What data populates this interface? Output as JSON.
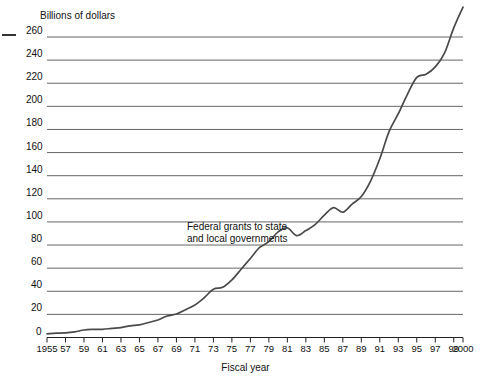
{
  "chart_data": {
    "type": "line",
    "title": "",
    "ylabel": "Billions of dollars",
    "xlabel": "Fiscal year",
    "ylim": [
      0,
      260
    ],
    "ytick_step": 20,
    "yticks": [
      260,
      240,
      220,
      200,
      180,
      160,
      140,
      120,
      100,
      80,
      60,
      40,
      20,
      0
    ],
    "xlim": [
      1955,
      2000
    ],
    "xticks": [
      1955,
      1957,
      1959,
      1961,
      1963,
      1965,
      1967,
      1969,
      1971,
      1973,
      1975,
      1977,
      1979,
      1981,
      1983,
      1985,
      1987,
      1989,
      1991,
      1993,
      1995,
      1997,
      1999,
      2000
    ],
    "xtick_labels": [
      "1955",
      "57",
      "59",
      "61",
      "63",
      "65",
      "67",
      "69",
      "71",
      "73",
      "75",
      "77",
      "79",
      "81",
      "83",
      "85",
      "87",
      "89",
      "91",
      "93",
      "95",
      "97",
      "99",
      "2000"
    ],
    "grid": "horizontal",
    "legend": "none",
    "annotation": {
      "line1": "Federal grants to state",
      "line2": "and local governments"
    },
    "series": [
      {
        "name": "Federal grants to state and local governments",
        "color": "#4a4a4a",
        "x": [
          1955,
          1956,
          1957,
          1958,
          1959,
          1960,
          1961,
          1962,
          1963,
          1964,
          1965,
          1966,
          1967,
          1968,
          1969,
          1970,
          1971,
          1972,
          1973,
          1974,
          1975,
          1976,
          1977,
          1978,
          1979,
          1980,
          1981,
          1982,
          1983,
          1984,
          1985,
          1986,
          1987,
          1988,
          1989,
          1990,
          1991,
          1992,
          1993,
          1994,
          1995,
          1996,
          1997,
          1998,
          1999,
          2000
        ],
        "values": [
          3.2,
          3.7,
          4.0,
          4.9,
          6.5,
          7.0,
          7.1,
          7.9,
          8.6,
          10.1,
          10.9,
          13.0,
          15.2,
          18.6,
          20.3,
          24.1,
          28.1,
          34.4,
          41.8,
          43.4,
          49.8,
          59.1,
          68.4,
          77.9,
          82.9,
          91.4,
          94.8,
          88.2,
          92.5,
          97.6,
          105.9,
          112.4,
          108.4,
          115.4,
          122.0,
          135.4,
          154.6,
          178.1,
          193.6,
          210.6,
          225.0,
          227.8,
          234.2,
          246.1,
          267.9,
          285.9
        ],
        "note": "Plotted curve values as read from the graph, billions of dollars"
      }
    ]
  }
}
